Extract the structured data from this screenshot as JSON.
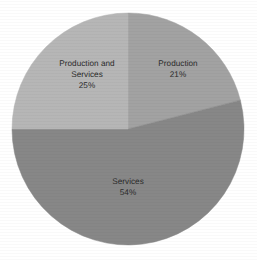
{
  "chart_data": {
    "type": "pie",
    "title": "",
    "subtitle": "",
    "xlabel": "",
    "ylabel": "",
    "legend_position": "none",
    "grid": false,
    "labels_inside_slices": true,
    "start_angle_deg": 0,
    "direction": "clockwise",
    "categories": [
      "Production",
      "Services",
      "Production and Services"
    ],
    "values": [
      21,
      54,
      25
    ],
    "value_unit": "percent",
    "slices": [
      {
        "name": "Production",
        "value": 21,
        "value_label": "21%",
        "color": "#a2a2a2",
        "start_angle_deg": 0,
        "end_angle_deg": 75.6
      },
      {
        "name": "Services",
        "value": 54,
        "value_label": "54%",
        "color": "#878787",
        "start_angle_deg": 75.6,
        "end_angle_deg": 270
      },
      {
        "name": "Production and Services",
        "value": 25,
        "value_label": "25%",
        "color": "#b6b6b6",
        "start_angle_deg": 270,
        "end_angle_deg": 360
      }
    ]
  },
  "labels": {
    "production": {
      "name": "Production",
      "value": "21%"
    },
    "services": {
      "name": "Services",
      "value": "54%"
    },
    "production_and_services": {
      "name_line_1": "Production and",
      "name_line_2": "Services",
      "value": "25%"
    }
  },
  "geometry": {
    "center_x": 128,
    "center_y": 129,
    "radius": 116
  },
  "colors": {
    "background": "#ffffff",
    "text": "#2b2b2b",
    "slice_production": "#a2a2a2",
    "slice_services": "#878787",
    "slice_production_and_services": "#b6b6b6"
  }
}
